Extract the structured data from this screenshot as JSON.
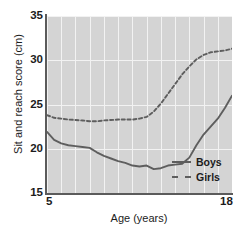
{
  "chart_data": {
    "type": "line",
    "title": "",
    "xlabel": "Age (years)",
    "ylabel": "Sit and reach score (cm)",
    "xlim": [
      5,
      18
    ],
    "ylim": [
      15,
      35
    ],
    "xticks": [
      "5",
      "18"
    ],
    "yticks": [
      "15",
      "20",
      "25",
      "30",
      "35"
    ],
    "grid": "both-white-on-gray",
    "legend_position": "bottom-right",
    "x": [
      5,
      5.5,
      6,
      6.5,
      7,
      7.5,
      8,
      8.5,
      9,
      9.5,
      10,
      10.5,
      11,
      11.5,
      12,
      12.5,
      13,
      13.5,
      14,
      14.5,
      15,
      15.5,
      16,
      16.5,
      17,
      17.5,
      18
    ],
    "series": [
      {
        "name": "Boys",
        "style": "solid",
        "color": "#5e5e5e",
        "values": [
          21.9,
          21.0,
          20.6,
          20.4,
          20.3,
          20.2,
          20.1,
          19.6,
          19.2,
          18.9,
          18.6,
          18.4,
          18.1,
          18.0,
          18.1,
          17.7,
          17.8,
          18.1,
          18.2,
          18.3,
          19.0,
          20.4,
          21.6,
          22.5,
          23.4,
          24.6,
          26.0
        ]
      },
      {
        "name": "Girls",
        "style": "dashed",
        "color": "#5e5e5e",
        "values": [
          23.8,
          23.5,
          23.4,
          23.3,
          23.25,
          23.2,
          23.1,
          23.1,
          23.2,
          23.25,
          23.3,
          23.3,
          23.3,
          23.4,
          23.6,
          24.2,
          25.1,
          26.2,
          27.3,
          28.4,
          29.3,
          30.1,
          30.6,
          30.9,
          31.0,
          31.1,
          31.3
        ]
      }
    ]
  },
  "legend": {
    "items": [
      {
        "label": "Boys",
        "style": "solid"
      },
      {
        "label": "Girls",
        "style": "dashed"
      }
    ]
  }
}
